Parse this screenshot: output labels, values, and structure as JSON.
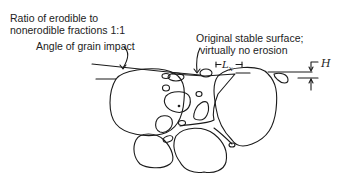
{
  "diagram": {
    "type": "cross-section schematic",
    "labels": {
      "ratio_line1": "Ratio of erodible to",
      "ratio_line2": "nonerodible fractions 1:1",
      "angle": "Angle of grain impact",
      "original_line1": "Original stable surface;",
      "original_line2": "virtually no erosion",
      "lx": "L",
      "lx_sub": "x",
      "h": "H"
    },
    "elements": [
      {
        "name": "impact-angle-line",
        "description": "Inclined line tangent to large left grain"
      },
      {
        "name": "original-surface-line",
        "description": "Horizontal line of original stable surface"
      },
      {
        "name": "large-grain-left",
        "description": "Large nonerodible grain, left"
      },
      {
        "name": "large-grain-right",
        "description": "Large nonerodible grain, right"
      },
      {
        "name": "lower-grain-left",
        "description": "Lower medium grain, left"
      },
      {
        "name": "lower-grain-center",
        "description": "Lower medium grain, center"
      },
      {
        "name": "small-erodible-grains",
        "description": "Small erodible grains filling gaps"
      },
      {
        "name": "lx-dimension",
        "description": "Horizontal spacing dimension between elements"
      },
      {
        "name": "h-dimension",
        "description": "Vertical height dimension of grain above eroded surface"
      }
    ]
  }
}
